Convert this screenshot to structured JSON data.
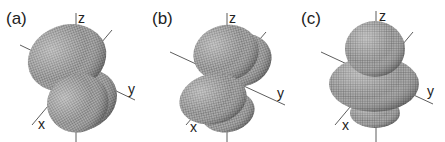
{
  "figure": {
    "panels": [
      {
        "label": "(a)",
        "axes": {
          "x": "x",
          "y": "y",
          "z": "z"
        },
        "shape": "two-lobe orbital tilted in xy-z plane"
      },
      {
        "label": "(b)",
        "axes": {
          "x": "x",
          "y": "y",
          "z": "z"
        },
        "shape": "two-lobe orbital, lobes above and below y axis"
      },
      {
        "label": "(c)",
        "axes": {
          "x": "x",
          "y": "y",
          "z": "z"
        },
        "shape": "dz2 orbital: lobes along z with toroidal ring"
      }
    ],
    "colors": {
      "surface": "#9a9a9a",
      "mesh": "#5a5a5a",
      "axis": "#333333",
      "background": "#ffffff"
    }
  }
}
